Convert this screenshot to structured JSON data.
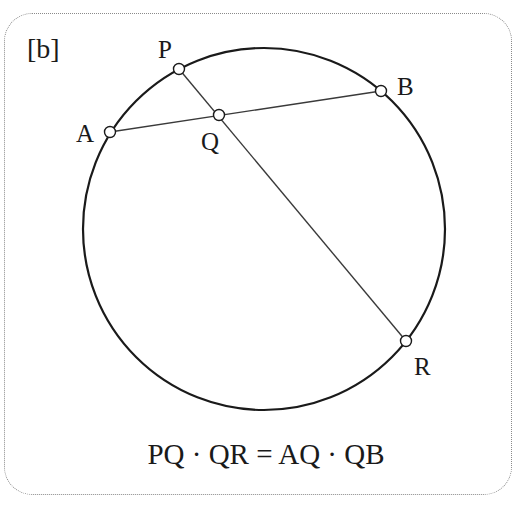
{
  "panel_label": "[b]",
  "equation": "PQ · QR = AQ · QB",
  "colors": {
    "stroke": "#1a1a1a",
    "chord": "#3a3a3a",
    "frame": "#8a8a8a",
    "point_fill": "#ffffff",
    "background": "#ffffff"
  },
  "circle": {
    "cx": 264,
    "cy": 229,
    "r": 181
  },
  "points": [
    {
      "name": "P",
      "x": 179,
      "y": 69,
      "label": "P",
      "label_x": 158,
      "label_y": 58
    },
    {
      "name": "A",
      "x": 110,
      "y": 132,
      "label": "A",
      "label_x": 76,
      "label_y": 142
    },
    {
      "name": "Q",
      "x": 219,
      "y": 115,
      "label": "Q",
      "label_x": 201,
      "label_y": 150
    },
    {
      "name": "B",
      "x": 381,
      "y": 91,
      "label": "B",
      "label_x": 398,
      "label_y": 94
    },
    {
      "name": "R",
      "x": 406,
      "y": 341,
      "label": "R",
      "label_x": 414,
      "label_y": 375
    }
  ],
  "chords": [
    {
      "name": "chord-ab",
      "from": "A",
      "to": "B"
    },
    {
      "name": "chord-pr",
      "from": "P",
      "to": "R"
    }
  ]
}
